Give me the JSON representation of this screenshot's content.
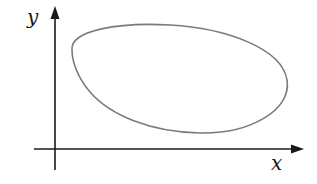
{
  "diagram": {
    "type": "closed-curve-in-plane",
    "axes": {
      "x_label": "x",
      "y_label": "y",
      "axis_color": "#1a1a1a"
    },
    "curve": {
      "shape": "closed-loop",
      "stroke_color": "#7a7a7a"
    }
  }
}
